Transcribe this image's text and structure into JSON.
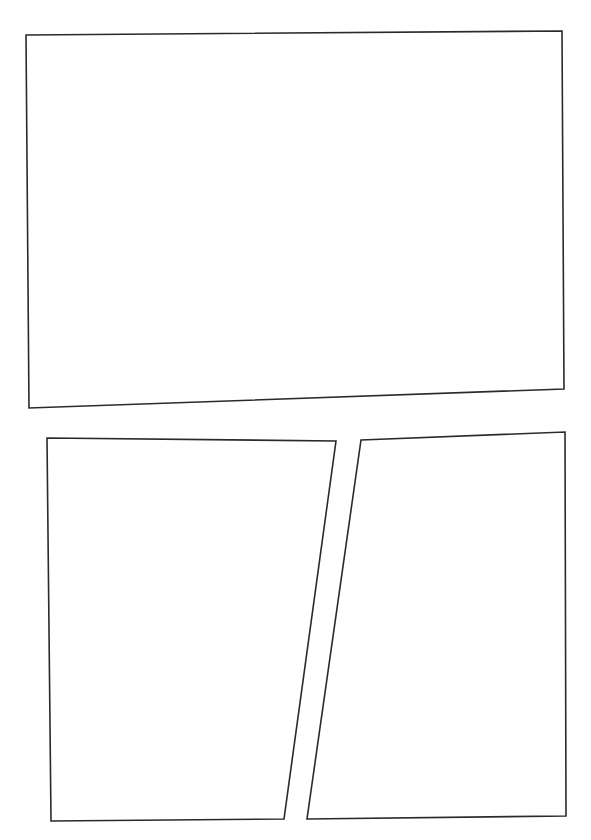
{
  "page": {
    "type": "comic-page-layout",
    "background": "#ffffff",
    "border_color": "#2a2a2a",
    "panel_count": 3
  },
  "panels": [
    {
      "id": "panel-1",
      "label": "top wide panel",
      "points": "26,35 562,31 564,389 29,408"
    },
    {
      "id": "panel-2",
      "label": "bottom left panel",
      "points": "47,438 336,441 284,819 51,821"
    },
    {
      "id": "panel-3",
      "label": "bottom right panel",
      "points": "361,440 565,432 566,816 307,819"
    }
  ]
}
